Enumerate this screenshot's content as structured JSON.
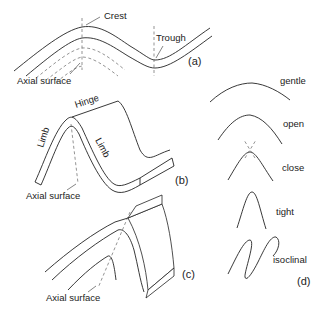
{
  "panel_a": {
    "crest_label": "Crest",
    "trough_label": "Trough",
    "axial_label": "Axial surface",
    "tag": "(a)"
  },
  "panel_b": {
    "hinge_label": "Hinge",
    "limb_left_label": "Limb",
    "limb_right_label": "Limb",
    "axial_label": "Axial surface",
    "tag": "(b)"
  },
  "panel_c": {
    "axial_label": "Axial surface",
    "tag": "(c)"
  },
  "panel_d": {
    "tag": "(d)",
    "fold_types": [
      {
        "label": "gentle"
      },
      {
        "label": "open"
      },
      {
        "label": "close"
      },
      {
        "label": "tight"
      },
      {
        "label": "isoclinal"
      }
    ]
  }
}
